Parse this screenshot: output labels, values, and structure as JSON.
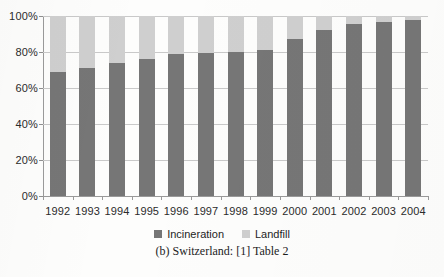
{
  "chart_data": {
    "type": "bar",
    "subtype": "stacked-100-percent",
    "title": "",
    "xlabel": "",
    "ylabel": "",
    "ylim": [
      0,
      100
    ],
    "yticks": [
      "0%",
      "20%",
      "40%",
      "60%",
      "80%",
      "100%"
    ],
    "ytick_values": [
      0,
      20,
      40,
      60,
      80,
      100
    ],
    "grid": true,
    "legend_position": "bottom-center",
    "categories": [
      "1992",
      "1993",
      "1994",
      "1995",
      "1996",
      "1997",
      "1998",
      "1999",
      "2000",
      "2001",
      "2002",
      "2003",
      "2004"
    ],
    "series": [
      {
        "name": "Incineration",
        "color": "#767676",
        "values": [
          69,
          71,
          74,
          76,
          79,
          79.5,
          80,
          81,
          87,
          92,
          95.5,
          96.5,
          98
        ]
      },
      {
        "name": "Landfill",
        "color": "#cfcfcf",
        "values": [
          31,
          29,
          26,
          24,
          21,
          20.5,
          20,
          19,
          13,
          8,
          4.5,
          3.5,
          2
        ]
      }
    ],
    "annotations": []
  },
  "legend": {
    "items": [
      {
        "label": "Incineration",
        "swatch_color": "#767676",
        "swatch_icon": "legend-square-icon"
      },
      {
        "label": "Landfill",
        "swatch_color": "#cfcfcf",
        "swatch_icon": "legend-square-icon"
      }
    ]
  },
  "caption": {
    "text": "(b) Switzerland: [1] Table 2"
  }
}
